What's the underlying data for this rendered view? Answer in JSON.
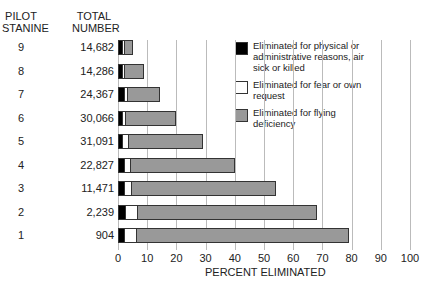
{
  "chart_data": {
    "type": "bar",
    "orientation": "horizontal-stacked",
    "xlabel": "PERCENT ELIMINATED",
    "xlim": [
      0,
      100
    ],
    "xticks": [
      0,
      10,
      20,
      30,
      40,
      50,
      60,
      70,
      80,
      90,
      100
    ],
    "col_headers": [
      "PILOT STANINE",
      "TOTAL NUMBER"
    ],
    "categories": [
      "9",
      "8",
      "7",
      "6",
      "5",
      "4",
      "3",
      "2",
      "1"
    ],
    "totals": [
      "14,682",
      "14,286",
      "24,367",
      "30,066",
      "31,091",
      "22,827",
      "11,471",
      "2,239",
      "904"
    ],
    "series": [
      {
        "name": "Eliminated for physical or administrative reasons, air sick or killed",
        "color": "#000000",
        "values": [
          1.5,
          1.5,
          2,
          1.5,
          1.5,
          2,
          2,
          2.5,
          2
        ]
      },
      {
        "name": "Eliminated for fear or own request",
        "color": "#ffffff",
        "values": [
          0.5,
          0.5,
          1,
          1,
          2,
          2,
          2.5,
          4,
          4
        ]
      },
      {
        "name": "Eliminated for flying deficiency",
        "color": "#999999",
        "values": [
          3,
          7,
          11.5,
          17.5,
          25.5,
          36,
          49.5,
          61.5,
          73
        ]
      }
    ],
    "totals_pct": [
      5,
      9,
      14.5,
      20,
      29,
      40,
      54,
      68,
      79
    ]
  },
  "labels": {
    "h1": "PILOT STANINE",
    "h2": "TOTAL NUMBER",
    "xlabel": "PERCENT ELIMINATED"
  }
}
